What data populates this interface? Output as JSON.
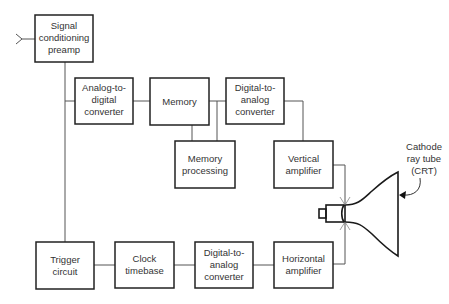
{
  "diagram": {
    "blocks": [
      {
        "id": "preamp",
        "lines": [
          "Signal",
          "conditioning",
          "preamp"
        ]
      },
      {
        "id": "adc",
        "lines": [
          "Analog-to-",
          "digital",
          "converter"
        ]
      },
      {
        "id": "memory",
        "lines": [
          "Memory"
        ]
      },
      {
        "id": "memproc",
        "lines": [
          "Memory",
          "processing"
        ]
      },
      {
        "id": "dac_v",
        "lines": [
          "Digital-to-",
          "analog",
          "converter"
        ]
      },
      {
        "id": "vamp",
        "lines": [
          "Vertical",
          "amplifier"
        ]
      },
      {
        "id": "trigger",
        "lines": [
          "Trigger",
          "circuit"
        ]
      },
      {
        "id": "clock",
        "lines": [
          "Clock",
          "timebase"
        ]
      },
      {
        "id": "dac_h",
        "lines": [
          "Digital-to-",
          "analog",
          "converter"
        ]
      },
      {
        "id": "hamp",
        "lines": [
          "Horizontal",
          "amplifier"
        ]
      }
    ],
    "crt_label": [
      "Cathode",
      "ray tube",
      "(CRT)"
    ],
    "colors": {
      "box_stroke": "#222222",
      "wire": "#555555",
      "text": "#333333"
    }
  }
}
